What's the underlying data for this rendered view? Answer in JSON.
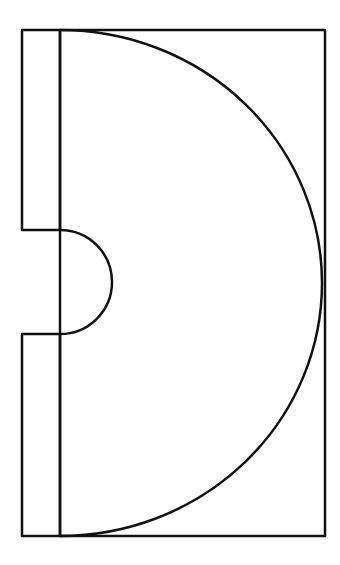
{
  "diagram": {
    "stroke_color": "#111111",
    "background_color": "#ffffff",
    "stroke_width": 2.5,
    "outer_rect": {
      "x": 60,
      "y": 30,
      "width": 265,
      "height": 506
    },
    "left_strip_top": {
      "x": 22,
      "y": 30,
      "width": 38,
      "height": 200
    },
    "left_strip_bottom": {
      "x": 22,
      "y": 334,
      "width": 38,
      "height": 202
    },
    "large_arc": {
      "start": [
        60,
        30
      ],
      "end": [
        60,
        536
      ],
      "rx": 262,
      "ry": 253
    },
    "notch_arc": {
      "start": [
        60,
        230
      ],
      "end": [
        60,
        334
      ],
      "r": 52
    }
  }
}
